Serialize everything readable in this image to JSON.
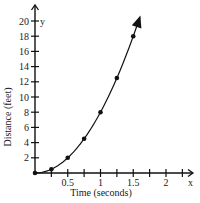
{
  "chart_data": {
    "type": "scatter",
    "title": "",
    "xlabel": "Time (seconds)",
    "ylabel": "Distance (feet)",
    "x_axis_name": "x",
    "y_axis_name": "y",
    "xlim": [
      0,
      2.25
    ],
    "ylim": [
      0,
      20
    ],
    "x_ticks": [
      0.25,
      0.5,
      0.75,
      1,
      1.25,
      1.5,
      1.75,
      2,
      2.25
    ],
    "x_tick_labels": [
      {
        "value": 0.5,
        "label": "0.5"
      },
      {
        "value": 1,
        "label": "1"
      },
      {
        "value": 1.5,
        "label": "1.5"
      },
      {
        "value": 2,
        "label": "2"
      }
    ],
    "y_ticks": [
      2,
      4,
      6,
      8,
      10,
      12,
      14,
      16,
      18,
      20
    ],
    "y_tick_labels": [
      "2",
      "4",
      "6",
      "8",
      "10",
      "12",
      "14",
      "16",
      "18",
      "20"
    ],
    "grid": false,
    "legend": null,
    "series": [
      {
        "name": "distance",
        "points": [
          {
            "x": 0,
            "y": 0
          },
          {
            "x": 0.25,
            "y": 0.5
          },
          {
            "x": 0.5,
            "y": 2
          },
          {
            "x": 0.75,
            "y": 4.5
          },
          {
            "x": 1,
            "y": 8
          },
          {
            "x": 1.25,
            "y": 12.5
          },
          {
            "x": 1.5,
            "y": 18
          }
        ],
        "curve": "d = 8t^2",
        "curve_extends_to_x": 1.6,
        "arrow_at_end": true
      }
    ]
  }
}
